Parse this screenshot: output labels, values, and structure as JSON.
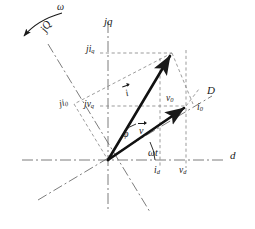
{
  "figure": {
    "type": "phasor-diagram",
    "width": 255,
    "height": 229,
    "background": "#ffffff",
    "stroke_color": "#1a1a1a",
    "text_color": "#1a1a1a"
  },
  "labels": {
    "omega": "ω",
    "jQ_axis": "jQ",
    "jq_axis": "jq",
    "d_axis": "d",
    "D_axis": "D",
    "ji_q": {
      "base": "ji",
      "sub": "q"
    },
    "ji_0": {
      "base": "ji",
      "sub": "0"
    },
    "jv_q": {
      "base": "jv",
      "sub": "q"
    },
    "v_0": {
      "base": "v",
      "sub": "0"
    },
    "i_0": {
      "base": "i",
      "sub": "0"
    },
    "i_d": {
      "base": "i",
      "sub": "d"
    },
    "v_d": {
      "base": "v",
      "sub": "d"
    },
    "current_vector": "i",
    "voltage_vector": "v",
    "phi_angle": "φ",
    "omega_t_angle": "ωt"
  },
  "geometry": {
    "origin": {
      "x": 108,
      "y": 160
    },
    "current_tip": {
      "x": 172,
      "y": 53
    },
    "voltage_tip": {
      "x": 186,
      "y": 106
    },
    "d_axis_left": {
      "x": 22,
      "y": 160
    },
    "d_axis_right": {
      "x": 226,
      "y": 160
    },
    "jq_axis_top": {
      "x": 108,
      "y": 22
    },
    "jq_axis_bottom": {
      "x": 108,
      "y": 212
    },
    "D_axis_tip": {
      "x": 212,
      "y": 96
    },
    "D_axis_back": {
      "x": 38,
      "y": 200
    },
    "jQ_axis_tip": {
      "x": 48,
      "y": 44
    },
    "jQ_axis_back": {
      "x": 150,
      "y": 212
    },
    "omega_arrow_start": {
      "x": 62,
      "y": 14
    },
    "omega_arrow_end": {
      "x": 22,
      "y": 38
    },
    "ji_q_level_y": 53,
    "jv_q_level_y": 106,
    "i_d_x": 160,
    "v_d_x": 186
  },
  "components": {
    "axes": [
      {
        "name": "d-axis",
        "style": "dash-dot",
        "label": "d"
      },
      {
        "name": "jq-axis",
        "style": "dash-dot",
        "label": "jq"
      },
      {
        "name": "D-axis",
        "style": "dash-dot",
        "label": "D"
      },
      {
        "name": "jQ-axis",
        "style": "dash-dot",
        "label": "jQ"
      }
    ],
    "vectors": [
      {
        "name": "current-phasor",
        "label": "i",
        "style": "solid-thick-arrow"
      },
      {
        "name": "voltage-phasor",
        "label": "v",
        "style": "solid-thick-arrow"
      }
    ],
    "projection_lines": "dashed",
    "angles": [
      {
        "name": "phi",
        "label": "φ",
        "between": [
          "v",
          "i"
        ]
      },
      {
        "name": "omega-t",
        "label": "ωt",
        "between": [
          "d-axis",
          "v"
        ]
      }
    ]
  }
}
